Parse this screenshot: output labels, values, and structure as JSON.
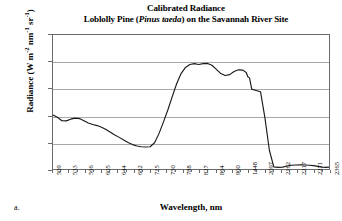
{
  "caption": "a.",
  "chart_data": {
    "type": "line",
    "title": "Calibrated Radiance",
    "subtitle_prefix": "Loblolly Pine (",
    "subtitle_species": "Pinus taeda",
    "subtitle_suffix": ") on the Savannah River Site",
    "title_full": "Calibrated Radiance Loblolly Pine (Pinus taeda) on the Savannah River Site",
    "xlabel": "Wavelength, nm",
    "ylabel": "Radiance (W m-2 nm-1 sr-1)",
    "ylabel_parts": {
      "lead": "Radiance (W m",
      "exp1": "-2",
      "mid1": " nm",
      "exp2": "-1",
      "mid2": " sr",
      "exp3": "-1",
      "tail": ")"
    },
    "ylim": [
      0,
      5000
    ],
    "ytick_values": [
      5000,
      4000,
      3000,
      2000,
      1000,
      0
    ],
    "ytick_labels": [
      "5000",
      "4000",
      "3000",
      "2000",
      "1000",
      "0"
    ],
    "grid": true,
    "grid_axis": "y",
    "legend": false,
    "legend_position": "none",
    "line_color": "#1a1a1a",
    "grid_color": "#a9a9a9",
    "frame_color": "#6b6b6b",
    "background_color": "#ffffff",
    "categories": [
      "509",
      "533",
      "566",
      "605",
      "644",
      "682",
      "715",
      "750",
      "788",
      "827",
      "864",
      "900",
      "1448",
      "2097",
      "2162",
      "2217",
      "2271",
      "2365"
    ],
    "series": [
      {
        "name": "Calibrated radiance",
        "values": [
          2010,
          1790,
          1900,
          1620,
          1180,
          830,
          2480,
          3930,
          3880,
          3500,
          3700,
          3380,
          60,
          140,
          150,
          120,
          60,
          70
        ]
      }
    ],
    "dense_x_fraction": [
      0.0,
      0.016,
      0.032,
      0.048,
      0.064,
      0.08,
      0.096,
      0.112,
      0.128,
      0.144,
      0.16,
      0.176,
      0.192,
      0.208,
      0.224,
      0.24,
      0.256,
      0.272,
      0.288,
      0.304,
      0.32,
      0.336,
      0.352,
      0.368,
      0.384,
      0.4,
      0.416,
      0.432,
      0.448,
      0.464,
      0.48,
      0.496,
      0.512,
      0.528,
      0.544,
      0.56,
      0.576,
      0.592,
      0.608,
      0.624,
      0.64,
      0.656,
      0.672,
      0.688,
      0.7,
      0.706,
      0.712,
      0.72,
      0.736,
      0.752,
      0.768,
      0.784,
      0.8,
      0.816,
      0.832,
      0.848,
      0.864,
      0.88,
      0.896,
      0.912,
      0.928,
      0.944,
      0.96,
      0.976,
      0.988,
      1.0
    ],
    "dense_values": [
      2010,
      1930,
      1800,
      1795,
      1860,
      1900,
      1880,
      1800,
      1720,
      1660,
      1620,
      1560,
      1470,
      1370,
      1270,
      1180,
      1080,
      990,
      910,
      860,
      830,
      820,
      830,
      980,
      1320,
      1750,
      2200,
      2700,
      3180,
      3560,
      3790,
      3900,
      3930,
      3900,
      3930,
      3940,
      3870,
      3720,
      3560,
      3490,
      3520,
      3640,
      3700,
      3690,
      3600,
      3440,
      3400,
      2980,
      2930,
      2880,
      1900,
      700,
      80,
      60,
      70,
      110,
      140,
      150,
      152,
      148,
      140,
      125,
      100,
      70,
      62,
      70
    ]
  }
}
